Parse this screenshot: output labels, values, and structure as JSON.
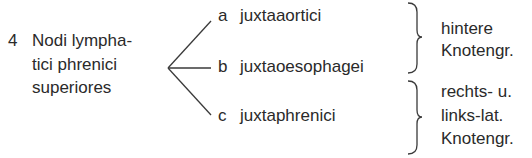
{
  "root": {
    "number": "4",
    "lines": [
      "Nodi lympha-",
      "tici phrenici",
      "superiores"
    ]
  },
  "branches": [
    {
      "letter": "a",
      "label": "juxtaaortici"
    },
    {
      "letter": "b",
      "label": "juxtaoesophagei"
    },
    {
      "letter": "c",
      "label": "juxtaphrenici"
    }
  ],
  "groups": [
    {
      "lines": [
        "hintere",
        "Knotengr."
      ]
    },
    {
      "lines": [
        "rechts- u.",
        "links-lat.",
        "Knotengr."
      ]
    }
  ],
  "colors": {
    "ink": "#2a2a2a",
    "background": "#ffffff"
  }
}
